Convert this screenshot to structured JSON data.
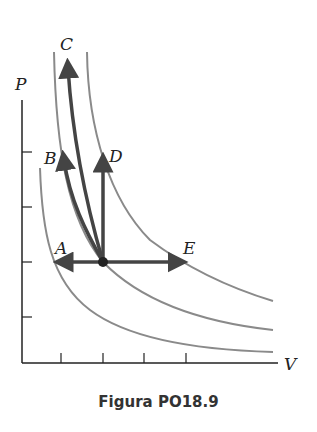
{
  "figure": {
    "caption": "Figura PO18.9",
    "axes": {
      "x_label": "V",
      "y_label": "P"
    },
    "labels": {
      "A": "A",
      "B": "B",
      "C": "C",
      "D": "D",
      "E": "E"
    },
    "colors": {
      "isotherm": "#8a8a8a",
      "path": "#444444",
      "axis": "#222222"
    }
  }
}
